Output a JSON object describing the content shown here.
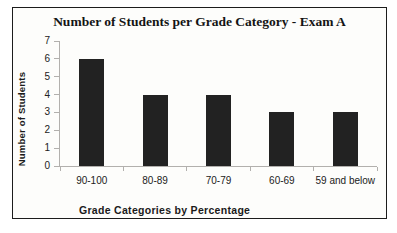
{
  "chart_data": {
    "type": "bar",
    "title": "Number of Students per Grade Category - Exam A",
    "categories": [
      "90-100",
      "80-89",
      "70-79",
      "60-69",
      "59 and below"
    ],
    "values": [
      6,
      4,
      4,
      3,
      3
    ],
    "xlabel": "Grade Categories by Percentage",
    "ylabel": "Number of Students",
    "ylim": [
      0,
      7
    ],
    "ytick_step": 1,
    "yticks": [
      0,
      1,
      2,
      3,
      4,
      5,
      6,
      7
    ],
    "grid": false,
    "legend": "none",
    "bar_color": "#222222",
    "axis_color": "#b2b0ad",
    "frame_border_color": "#1c1c1c",
    "background_color": "#fdfdfb"
  }
}
